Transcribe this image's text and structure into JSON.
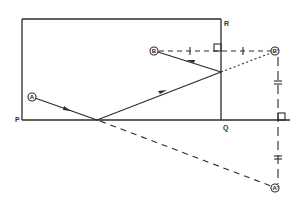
{
  "diagram": {
    "type": "reflection-geometry",
    "stroke_color": "#2b2b2b",
    "corner_labels": {
      "P": "P",
      "Q": "Q",
      "R": "R"
    },
    "points": {
      "A": "A",
      "B": "B",
      "B_image": "B'",
      "A_image": "A'"
    },
    "rectangle": {
      "x": 22,
      "y": 19,
      "width": 199,
      "height": 101
    },
    "segments": [
      {
        "name": "ray-A-to-floor",
        "from": [
          32,
          97
        ],
        "to": [
          97,
          120
        ],
        "style": "solid",
        "arrow": true
      },
      {
        "name": "ray-floor-to-wall",
        "from": [
          97,
          120
        ],
        "to": [
          221,
          72
        ],
        "style": "solid",
        "arrow": true
      },
      {
        "name": "ray-wall-to-B",
        "from": [
          221,
          72
        ],
        "to": [
          154,
          51
        ],
        "style": "solid",
        "arrow": true
      },
      {
        "name": "B-to-B-image",
        "from": [
          154,
          51
        ],
        "to": [
          275,
          51
        ],
        "style": "dashed"
      },
      {
        "name": "wall-to-B-image",
        "from": [
          221,
          72
        ],
        "to": [
          275,
          51
        ],
        "style": "dotted"
      },
      {
        "name": "floor-to-A-image",
        "from": [
          97,
          120
        ],
        "to": [
          275,
          188
        ],
        "style": "dashed"
      },
      {
        "name": "B-image-to-A-image",
        "from": [
          278,
          56
        ],
        "to": [
          278,
          185
        ],
        "style": "dash-long"
      }
    ]
  }
}
